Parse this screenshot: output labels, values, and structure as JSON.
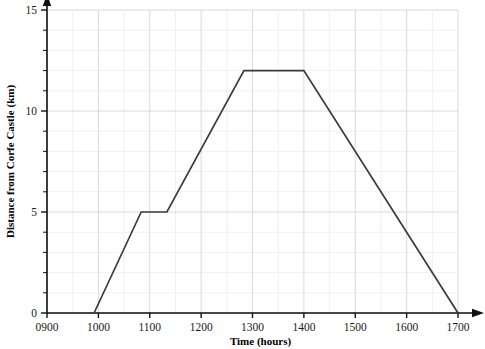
{
  "chart_data": {
    "type": "line",
    "title": "",
    "xlabel": "Time (hours)",
    "ylabel": "Distance from Corfe Castle (km)",
    "xlim": [
      900,
      1700
    ],
    "ylim": [
      0,
      15
    ],
    "grid": true,
    "legend": "none",
    "x_ticks": [
      "0900",
      "1000",
      "1100",
      "1200",
      "1300",
      "1400",
      "1500",
      "1600",
      "1700"
    ],
    "x_tick_values": [
      900,
      1000,
      1100,
      1200,
      1300,
      1400,
      1500,
      1600,
      1700
    ],
    "x_minor_step_minutes": 30,
    "y_ticks": [
      "0",
      "5",
      "10",
      "15"
    ],
    "y_tick_values": [
      0,
      5,
      10,
      15
    ],
    "y_minor_step": 1,
    "line_color": "#3a3a3a",
    "series": [
      {
        "name": "Journey",
        "x": [
          955,
          1050,
          1080,
          1250,
          1400,
          1700
        ],
        "y": [
          0,
          5,
          5,
          12,
          12,
          0
        ],
        "points": [
          {
            "time": "0955",
            "distance_km": 0
          },
          {
            "time": "1050",
            "distance_km": 5
          },
          {
            "time": "1080",
            "distance_km": 5
          },
          {
            "time": "1250",
            "distance_km": 12
          },
          {
            "time": "1400",
            "distance_km": 12
          },
          {
            "time": "1700",
            "distance_km": 0
          }
        ]
      }
    ]
  },
  "axes": {
    "x_title": "Time (hours)",
    "y_title": "Distance from Corfe Castle (km)"
  }
}
